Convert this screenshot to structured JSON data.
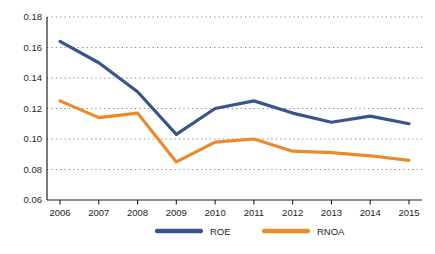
{
  "chart_data": {
    "type": "line",
    "title": "",
    "subtitle": "",
    "xlabel": "",
    "ylabel": "",
    "categories": [
      "2006",
      "2007",
      "2008",
      "2009",
      "2010",
      "2011",
      "2012",
      "2013",
      "2014",
      "2015"
    ],
    "x": [
      2006,
      2007,
      2008,
      2009,
      2010,
      2011,
      2012,
      2013,
      2014,
      2015
    ],
    "ylim": [
      0.06,
      0.18
    ],
    "yticks": [
      0.06,
      0.08,
      0.1,
      0.12,
      0.14,
      0.16,
      0.18
    ],
    "ytick_labels": [
      "0.06",
      "0.08",
      "0.10",
      "0.12",
      "0.14",
      "0.16",
      "0.18"
    ],
    "grid": true,
    "grid_style": "dotted",
    "grid_color": "#808080",
    "legend_position": "bottom",
    "series": [
      {
        "name": "ROE",
        "color": "#3A5490",
        "values": [
          0.164,
          0.15,
          0.131,
          0.103,
          0.12,
          0.125,
          0.117,
          0.111,
          0.115,
          0.11
        ]
      },
      {
        "name": "RNOA",
        "color": "#EA8A2B",
        "values": [
          0.125,
          0.114,
          0.117,
          0.085,
          0.098,
          0.1,
          0.092,
          0.091,
          0.089,
          0.086
        ]
      }
    ]
  },
  "axis": {
    "line_color": "#231f20"
  }
}
